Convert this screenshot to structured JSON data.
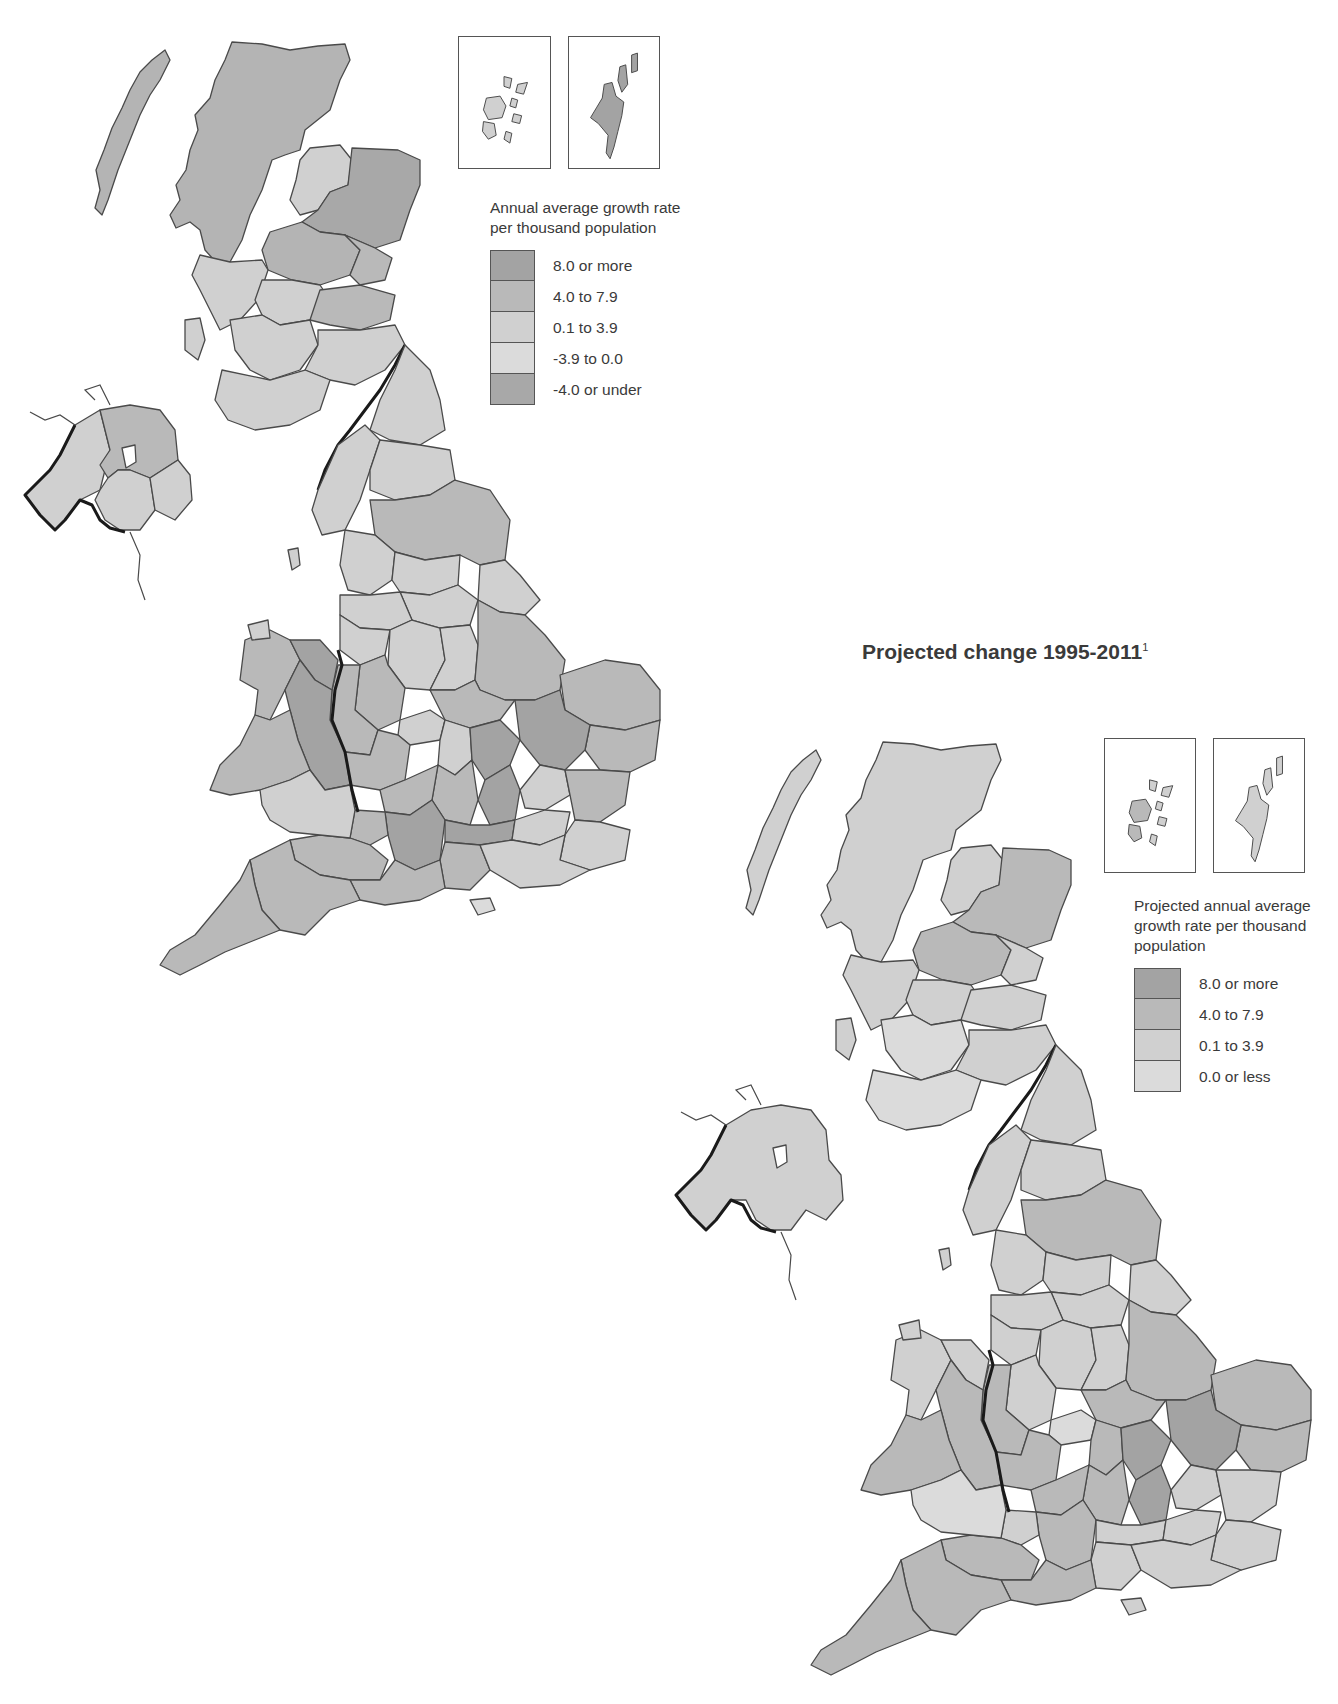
{
  "colors": {
    "c8": "#a3a3a3",
    "c4": "#b9b9b9",
    "c0": "#d0d0d0",
    "cneg": "#dbdbdb",
    "cneg4": "#a8a8a8",
    "outline": "#4a4a4a",
    "national_border": "#1a1a1a"
  },
  "map1": {
    "title": "",
    "legend": {
      "title_line1": "Annual average growth rate",
      "title_line2": "per thousand population",
      "items": [
        {
          "label": "8.0 or more",
          "color": "#a3a3a3"
        },
        {
          "label": "4.0 to 7.9",
          "color": "#b9b9b9"
        },
        {
          "label": "0.1 to 3.9",
          "color": "#d0d0d0"
        },
        {
          "label": "-3.9 to 0.0",
          "color": "#dbdbdb"
        },
        {
          "label": "-4.0 or under",
          "color": "#a8a8a8"
        }
      ]
    },
    "insets": [
      "Orkney",
      "Shetland"
    ]
  },
  "map2": {
    "title": "Projected change 1995-2011",
    "title_footnote": "1",
    "legend": {
      "title_line1": "Projected annual average",
      "title_line2": "growth rate per thousand",
      "title_line3": "population",
      "items": [
        {
          "label": "8.0 or more",
          "color": "#a3a3a3"
        },
        {
          "label": "4.0 to 7.9",
          "color": "#b9b9b9"
        },
        {
          "label": "0.1 to 3.9",
          "color": "#d0d0d0"
        },
        {
          "label": "0.0 or less",
          "color": "#dbdbdb"
        }
      ]
    },
    "insets": [
      "Orkney",
      "Shetland"
    ]
  }
}
